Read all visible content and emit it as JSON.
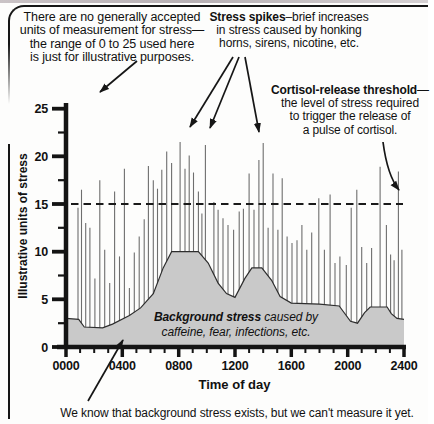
{
  "annotations": {
    "units_note": [
      "There are no generally accepted",
      "units of measurement for stress—",
      "the range of 0 to 25 used here",
      "is just for illustrative purposes."
    ],
    "spikes_note": {
      "bold": "Stress spikes",
      "after_bold": "–brief increases",
      "line2": "in stress caused by honking",
      "line3": "horns, sirens, nicotine, etc."
    },
    "cortisol_note": {
      "bold": "Cortisol-release threshold",
      "after_bold": "—",
      "line2": "the level of stress required",
      "line3": "to trigger the release of",
      "line4": "a pulse of cortisol."
    },
    "background_label": {
      "bold": "Background stress",
      "after_bold": " caused by",
      "line2": "caffeine, fear, infections, etc."
    },
    "caption": "We know that background stress exists, but we can't measure it yet."
  },
  "chart_data": {
    "type": "area",
    "subtype": "background-area-with-stress-spikes",
    "xlabel": "Time of day",
    "ylabel": "Illustrative units of stress",
    "x_ticks": [
      "0000",
      "0400",
      "0800",
      "1200",
      "1600",
      "2000",
      "2400"
    ],
    "x_major_step_hours": 4,
    "x_minor_step_hours": 1,
    "x_range_hours": [
      0,
      24
    ],
    "y_ticks": [
      0,
      5,
      10,
      15,
      20,
      25
    ],
    "y_minor_ticks": [
      2.5,
      7.5,
      12.5,
      17.5,
      22.5
    ],
    "y_range": [
      0,
      25
    ],
    "grid": "off",
    "threshold": {
      "name": "cortisol-release-threshold",
      "value": 15,
      "style": "dashed"
    },
    "background_area": {
      "points": [
        [
          0,
          3.0
        ],
        [
          0.9,
          2.9
        ],
        [
          1.3,
          2.1
        ],
        [
          2.6,
          2.0
        ],
        [
          3.3,
          2.4
        ],
        [
          4.5,
          3.3
        ],
        [
          5.3,
          4.1
        ],
        [
          6.2,
          5.6
        ],
        [
          6.9,
          8.3
        ],
        [
          7.5,
          10.0
        ],
        [
          9.4,
          10.0
        ],
        [
          10.1,
          8.8
        ],
        [
          10.8,
          6.7
        ],
        [
          11.4,
          5.6
        ],
        [
          12.0,
          5.2
        ],
        [
          12.7,
          7.2
        ],
        [
          13.2,
          8.3
        ],
        [
          13.9,
          8.3
        ],
        [
          14.6,
          7.0
        ],
        [
          15.2,
          5.3
        ],
        [
          16.0,
          4.6
        ],
        [
          18.0,
          4.5
        ],
        [
          19.4,
          4.3
        ],
        [
          20.2,
          2.7
        ],
        [
          20.7,
          2.5
        ],
        [
          21.2,
          3.6
        ],
        [
          21.6,
          4.2
        ],
        [
          22.8,
          4.2
        ],
        [
          23.1,
          3.5
        ],
        [
          23.5,
          3.0
        ],
        [
          24,
          2.9
        ]
      ]
    },
    "spikes": [
      [
        0.05,
        8.0
      ],
      [
        0.85,
        14.6
      ],
      [
        1.1,
        16.5
      ],
      [
        1.4,
        13.0
      ],
      [
        1.7,
        12.5
      ],
      [
        2.05,
        7.2
      ],
      [
        2.4,
        17.5
      ],
      [
        2.75,
        10.2
      ],
      [
        3.1,
        6.7
      ],
      [
        3.45,
        16.3
      ],
      [
        3.8,
        9.5
      ],
      [
        4.15,
        18.7
      ],
      [
        4.5,
        6.2
      ],
      [
        4.85,
        9.9
      ],
      [
        5.2,
        11.6
      ],
      [
        5.55,
        13.4
      ],
      [
        5.85,
        19.0
      ],
      [
        6.2,
        17.5
      ],
      [
        6.5,
        16.6
      ],
      [
        6.8,
        18.6
      ],
      [
        7.15,
        20.5
      ],
      [
        7.5,
        19.3
      ],
      [
        8.1,
        21.5
      ],
      [
        8.45,
        18.7
      ],
      [
        8.75,
        20.1
      ],
      [
        9.05,
        18.3
      ],
      [
        9.4,
        16.3
      ],
      [
        9.65,
        14.0
      ],
      [
        9.9,
        21.2
      ],
      [
        10.5,
        15.2
      ],
      [
        10.8,
        14.4
      ],
      [
        11.15,
        13.5
      ],
      [
        11.5,
        12.8
      ],
      [
        11.9,
        12.3
      ],
      [
        12.3,
        14.2
      ],
      [
        12.6,
        14.5
      ],
      [
        13.0,
        18.2
      ],
      [
        13.35,
        14.4
      ],
      [
        13.7,
        19.6
      ],
      [
        14.0,
        21.4
      ],
      [
        14.35,
        12.5
      ],
      [
        14.7,
        18.2
      ],
      [
        15.05,
        12.3
      ],
      [
        15.35,
        17.7
      ],
      [
        15.7,
        11.6
      ],
      [
        16.05,
        10.9
      ],
      [
        16.4,
        11.2
      ],
      [
        16.75,
        12.8
      ],
      [
        17.1,
        10.2
      ],
      [
        17.45,
        12.0
      ],
      [
        17.95,
        15.6
      ],
      [
        18.35,
        10.2
      ],
      [
        18.75,
        16.0
      ],
      [
        19.1,
        8.8
      ],
      [
        19.45,
        9.5
      ],
      [
        19.9,
        8.6
      ],
      [
        20.25,
        14.6
      ],
      [
        20.65,
        16.5
      ],
      [
        21.0,
        10.5
      ],
      [
        21.35,
        8.8
      ],
      [
        21.7,
        10.4
      ],
      [
        22.3,
        18.9
      ],
      [
        22.75,
        12.8
      ],
      [
        23.05,
        9.7
      ],
      [
        23.3,
        9.1
      ],
      [
        23.6,
        18.4
      ],
      [
        23.85,
        10.2
      ]
    ],
    "colors": {
      "area_fill": "#c9c9c9",
      "area_stroke": "#2e2e2e",
      "spike": "#6e6e6e",
      "axis": "#141414",
      "threshold": "#1a1a1a",
      "text": "#111111"
    }
  }
}
